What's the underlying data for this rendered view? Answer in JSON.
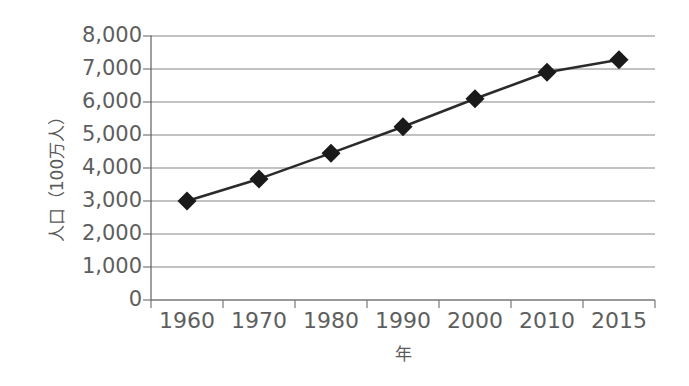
{
  "chart_data": {
    "type": "line",
    "title": "",
    "subtitle": "",
    "xlabel": "年",
    "ylabel": "人口（100万人）",
    "categories": [
      "1960",
      "1970",
      "1980",
      "1990",
      "2000",
      "2010",
      "2015"
    ],
    "x": [
      1960,
      1970,
      1980,
      1990,
      2000,
      2010,
      2015
    ],
    "values": [
      3000,
      3670,
      4450,
      5250,
      6100,
      6900,
      7280
    ],
    "series": [
      {
        "name": "人口",
        "values": [
          3000,
          3670,
          4450,
          5250,
          6100,
          6900,
          7280
        ]
      }
    ],
    "ylim": [
      0,
      8000
    ],
    "ytick_labels": [
      "0",
      "1,000",
      "2,000",
      "3,000",
      "4,000",
      "5,000",
      "6,000",
      "7,000",
      "8,000"
    ],
    "ytick_values": [
      0,
      1000,
      2000,
      3000,
      4000,
      5000,
      6000,
      7000,
      8000
    ],
    "grid": true,
    "grid_axis": "y",
    "legend": false,
    "legend_position": "none",
    "marker": "diamond",
    "colors": {
      "line": "#2b2b2b",
      "marker": "#1a1a1a",
      "gridline": "#868686",
      "axis": "#777777",
      "text": "#5e5e5e",
      "background": "#ffffff"
    }
  },
  "axes": {
    "y_title": "人口（100万人）",
    "x_title": "年"
  }
}
